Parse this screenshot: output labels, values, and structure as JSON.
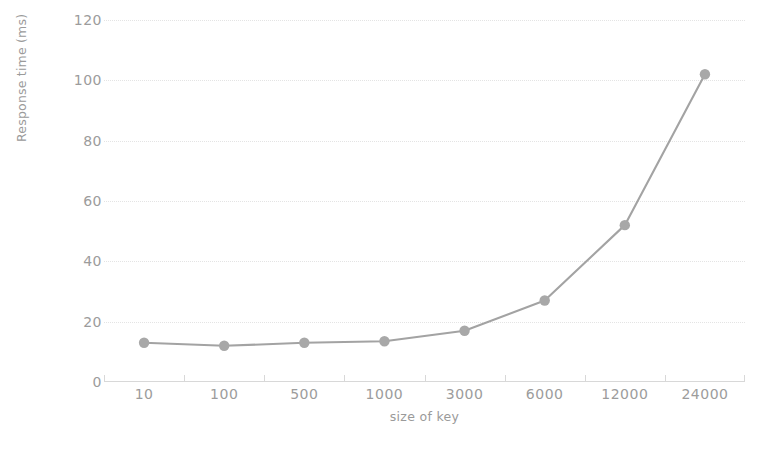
{
  "chart_data": {
    "type": "line",
    "title": "",
    "subtitle": "",
    "xlabel": "size of key",
    "ylabel": "Response time (ms)",
    "categories": [
      "10",
      "100",
      "500",
      "1000",
      "3000",
      "6000",
      "12000",
      "24000"
    ],
    "values": [
      13,
      12,
      13,
      13.5,
      17,
      27,
      52,
      102
    ],
    "series": [
      {
        "name": "Response time",
        "values": [
          13,
          12,
          13,
          13.5,
          17,
          27,
          52,
          102
        ]
      }
    ],
    "ylim": [
      0,
      120
    ],
    "y_ticks": [
      0,
      20,
      40,
      60,
      80,
      100,
      120
    ],
    "y_tick_labels": [
      "0",
      "20",
      "40",
      "60",
      "80",
      "100",
      "120"
    ],
    "grid": true,
    "grid_axis": "y",
    "legend": false,
    "legend_position": "none",
    "marker": "circle",
    "colors": {
      "line": "#a3a3a3",
      "marker": "#a8a8a8",
      "grid": "#e4e4e4",
      "axis": "#d8d8d8",
      "text": "#9c9c9c",
      "background": "#ffffff"
    }
  }
}
